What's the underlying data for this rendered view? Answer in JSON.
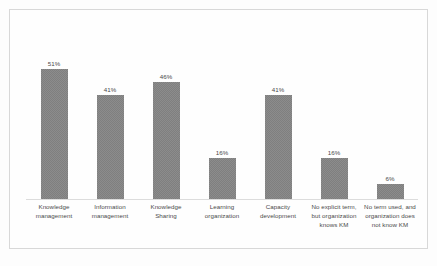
{
  "chart_data": {
    "type": "bar",
    "title": "",
    "subtitle": "",
    "xlabel": "",
    "ylabel": "",
    "ylim": [
      0,
      68
    ],
    "grid": false,
    "legend": false,
    "legend_position": "none",
    "bar_color": "#7f7f7f",
    "value_suffix": "%",
    "categories": [
      "Knowledge management",
      "Information management",
      "Knowledge Sharing",
      "Learning organization",
      "Capacity development",
      "No explicit term, but organization knows KM",
      "No term used, and organization does not know KM"
    ],
    "values": [
      51,
      41,
      46,
      16,
      41,
      16,
      6
    ],
    "value_labels": [
      "51%",
      "41%",
      "46%",
      "16%",
      "41%",
      "16%",
      "6%"
    ],
    "bars": [
      {
        "category": "Knowledge management",
        "value": 51,
        "label": "51%"
      },
      {
        "category": "Information management",
        "value": 41,
        "label": "41%"
      },
      {
        "category": "Knowledge Sharing",
        "value": 46,
        "label": "46%"
      },
      {
        "category": "Learning organization",
        "value": 16,
        "label": "16%"
      },
      {
        "category": "Capacity development",
        "value": 41,
        "label": "41%"
      },
      {
        "category": "No explicit term, but organization knows KM",
        "value": 16,
        "label": "16%"
      },
      {
        "category": "No term used, and organization does not know KM",
        "value": 6,
        "label": "6%"
      }
    ]
  }
}
